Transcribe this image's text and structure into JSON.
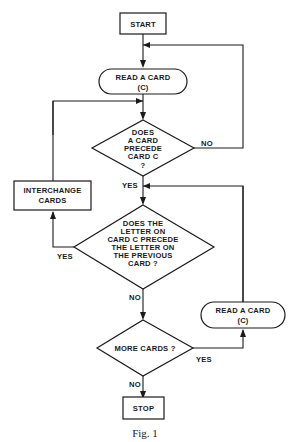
{
  "diagram": {
    "nodes": {
      "start": {
        "label": "START"
      },
      "read1": {
        "line1": "READ A CARD",
        "line2": "(C)"
      },
      "dec1": {
        "lines": [
          "DOES",
          "A CARD",
          "PRECEDE",
          "CARD C",
          "?"
        ]
      },
      "interchange": {
        "line1": "INTERCHANGE",
        "line2": "CARDS"
      },
      "dec2": {
        "lines": [
          "DOES THE",
          "LETTER ON",
          "CARD C PRECEDE",
          "THE LETTER ON",
          "THE PREVIOUS",
          "CARD ?"
        ]
      },
      "read2": {
        "line1": "READ A CARD",
        "line2": "(C)"
      },
      "dec3": {
        "label": "MORE CARDS ?"
      },
      "stop": {
        "label": "STOP"
      }
    },
    "edges": {
      "dec1_no": "NO",
      "dec1_yes": "YES",
      "dec2_yes": "YES",
      "dec2_no": "NO",
      "dec3_yes": "YES",
      "dec3_no": "NO"
    },
    "caption": "Fig. 1"
  }
}
